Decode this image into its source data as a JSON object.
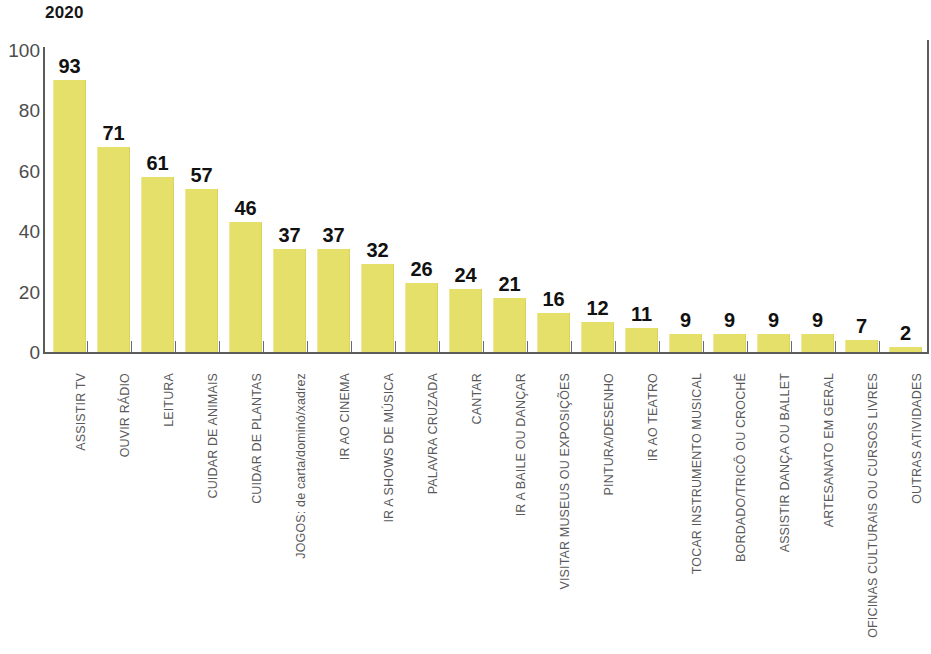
{
  "chart_data": {
    "type": "bar",
    "title": "2020",
    "xlabel": "",
    "ylabel": "",
    "ylim": [
      0,
      100
    ],
    "yticks": [
      0,
      20,
      40,
      60,
      80,
      100
    ],
    "grid": false,
    "legend": "none",
    "bar_color": "#e5e069",
    "value_label_color": "#111111",
    "category_label_color": "#59595b",
    "axis_color": "#5c5c5c",
    "categories": [
      "ASSISTIR TV",
      "OUVIR RÁDIO",
      "LEITURA",
      "CUIDAR DE ANIMAIS",
      "CUIDAR DE PLANTAS",
      "JOGOS: de carta/dominó/xadrez",
      "IR AO CINEMA",
      "IR A SHOWS DE MÚSICA",
      "PALAVRA CRUZADA",
      "CANTAR",
      "IR A BAILE OU DANÇAR",
      "VISITAR MUSEUS OU EXPOSIÇÕES",
      "PINTURA/DESENHO",
      "IR AO TEATRO",
      "TOCAR INSTRUMENTO MUSICAL",
      "BORDADO/TRICÔ OU CROCHÊ",
      "ASSISTIR DANÇA OU BALLET",
      "ARTESANATO EM GERAL",
      "OFICINAS CULTURAIS OU CURSOS LIVRES",
      "OUTRAS ATIVIDADES"
    ],
    "values": [
      93,
      71,
      61,
      57,
      46,
      37,
      37,
      32,
      26,
      24,
      21,
      16,
      12,
      11,
      9,
      9,
      9,
      9,
      7,
      2
    ],
    "bar_heights_drawn": [
      90,
      68,
      58,
      54,
      43,
      34,
      34,
      29,
      23,
      21,
      18,
      13,
      10,
      8,
      6,
      6,
      6,
      6,
      4,
      1.5
    ]
  }
}
